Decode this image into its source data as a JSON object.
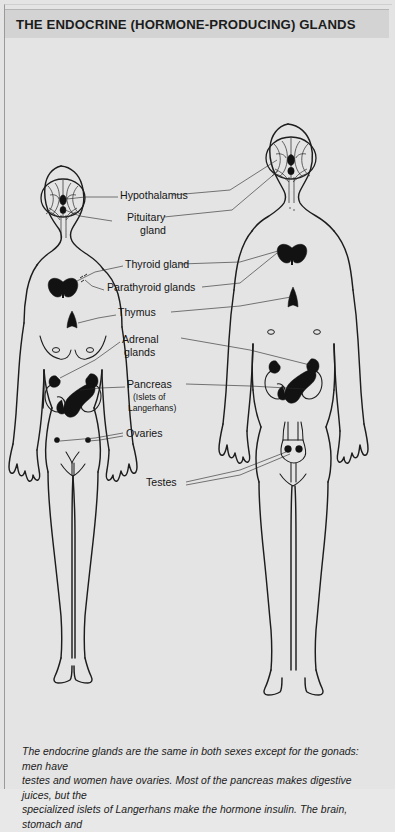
{
  "page": {
    "title": "THE ENDOCRINE (HORMONE-PRODUCING) GLANDS",
    "background_color": "#e4e4e4",
    "title_bar_color": "#d3d3d3",
    "ink_color": "#1d1d1d"
  },
  "diagram": {
    "type": "anatomical-illustration",
    "figures": [
      {
        "id": "female",
        "label": "female figure",
        "side": "left"
      },
      {
        "id": "male",
        "label": "male figure",
        "side": "right"
      }
    ],
    "labels": [
      {
        "id": "hypothalamus",
        "text": "Hypothalamus"
      },
      {
        "id": "pituitary",
        "line1": "Pituitary",
        "line2": "gland"
      },
      {
        "id": "thyroid",
        "text": "Thyroid gland"
      },
      {
        "id": "parathyroid",
        "text": "Parathyroid glands"
      },
      {
        "id": "thymus",
        "text": "Thymus"
      },
      {
        "id": "adrenal",
        "line1": "Adrenal",
        "line2": "glands"
      },
      {
        "id": "pancreas",
        "text": "Pancreas",
        "sub1": "(Islets of",
        "sub2": "Langerhans)"
      },
      {
        "id": "ovaries",
        "text": "Ovaries"
      },
      {
        "id": "testes",
        "text": "Testes"
      }
    ]
  },
  "caption": {
    "line1": "The endocrine glands are the same in both sexes except for the gonads: men have",
    "line2": "testes and women have ovaries. Most of the pancreas makes digestive juices, but the",
    "line3": "specialized islets of Langerhans make the hormone insulin. The brain, stomach and"
  }
}
